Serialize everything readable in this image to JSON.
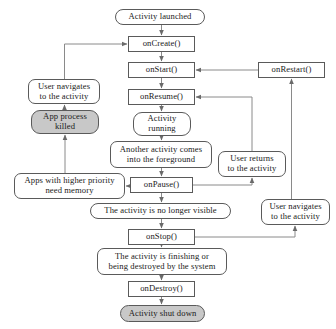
{
  "diagram": {
    "type": "flowchart",
    "canvas": {
      "width": 336,
      "height": 329
    },
    "colors": {
      "stroke": "#5a5a5a",
      "text": "#1a1a1a",
      "terminal_fill": "#c8c8c8",
      "node_fill": "#ffffff"
    },
    "nodes": [
      {
        "id": "activity-launched",
        "label": "Activity launched",
        "shape": "pill",
        "fill": "white",
        "x": 115,
        "y": 9,
        "w": 90,
        "h": 16
      },
      {
        "id": "on-create",
        "label": "onCreate()",
        "shape": "rect",
        "fill": "white",
        "x": 128,
        "y": 36,
        "w": 67,
        "h": 16
      },
      {
        "id": "on-start",
        "label": "onStart()",
        "shape": "rect",
        "fill": "white",
        "x": 128,
        "y": 62,
        "w": 67,
        "h": 16
      },
      {
        "id": "on-restart",
        "label": "onRestart()",
        "shape": "rect",
        "fill": "white",
        "x": 258,
        "y": 62,
        "w": 67,
        "h": 16
      },
      {
        "id": "user-navigates-left",
        "label": "User navigates\nto the activity",
        "shape": "round",
        "fill": "white",
        "x": 28,
        "y": 79,
        "w": 72,
        "h": 25
      },
      {
        "id": "on-resume",
        "label": "onResume()",
        "shape": "rect",
        "fill": "white",
        "x": 128,
        "y": 89,
        "w": 67,
        "h": 16
      },
      {
        "id": "app-process-killed",
        "label": "App process\nkilled",
        "shape": "pill",
        "fill": "gray",
        "x": 31,
        "y": 110,
        "w": 68,
        "h": 24
      },
      {
        "id": "activity-running",
        "label": "Activity\nrunning",
        "shape": "pill",
        "fill": "white",
        "x": 133,
        "y": 112,
        "w": 58,
        "h": 24
      },
      {
        "id": "another-activity",
        "label": "Another activity comes\ninto the foreground",
        "shape": "round",
        "fill": "white",
        "x": 110,
        "y": 141,
        "w": 102,
        "h": 27
      },
      {
        "id": "user-returns",
        "label": "User returns\nto the activity",
        "shape": "round",
        "fill": "white",
        "x": 218,
        "y": 151,
        "w": 68,
        "h": 26
      },
      {
        "id": "apps-higher-priority",
        "label": "Apps with higher priority\nneed memory",
        "shape": "round",
        "fill": "white",
        "x": 14,
        "y": 173,
        "w": 111,
        "h": 26
      },
      {
        "id": "on-pause",
        "label": "onPause()",
        "shape": "rect",
        "fill": "white",
        "x": 130,
        "y": 177,
        "w": 63,
        "h": 16
      },
      {
        "id": "no-longer-visible",
        "label": "The activity is no longer visible",
        "shape": "pill",
        "fill": "white",
        "x": 90,
        "y": 203,
        "w": 141,
        "h": 16
      },
      {
        "id": "user-navigates-right",
        "label": "User navigates\nto the activity",
        "shape": "round",
        "fill": "white",
        "x": 261,
        "y": 199,
        "w": 69,
        "h": 26
      },
      {
        "id": "on-stop",
        "label": "onStop()",
        "shape": "rect",
        "fill": "white",
        "x": 128,
        "y": 229,
        "w": 67,
        "h": 16
      },
      {
        "id": "finishing-destroyed",
        "label": "The activity is finishing or\nbeing destroyed by the system",
        "shape": "round",
        "fill": "white",
        "x": 97,
        "y": 248,
        "w": 130,
        "h": 27
      },
      {
        "id": "on-destroy",
        "label": "onDestroy()",
        "shape": "rect",
        "fill": "white",
        "x": 128,
        "y": 281,
        "w": 67,
        "h": 16
      },
      {
        "id": "activity-shut-down",
        "label": "Activity shut down",
        "shape": "pill",
        "fill": "gray",
        "x": 120,
        "y": 305,
        "w": 85,
        "h": 17
      }
    ],
    "edges": [
      {
        "from": "activity-launched",
        "to": "on-create",
        "label": ""
      },
      {
        "from": "on-create",
        "to": "on-start",
        "label": ""
      },
      {
        "from": "on-start",
        "to": "on-resume",
        "label": ""
      },
      {
        "from": "on-resume",
        "to": "activity-running",
        "label": ""
      },
      {
        "from": "activity-running",
        "to": "another-activity",
        "label": ""
      },
      {
        "from": "another-activity",
        "to": "on-pause",
        "label": ""
      },
      {
        "from": "on-pause",
        "to": "no-longer-visible",
        "label": ""
      },
      {
        "from": "no-longer-visible",
        "to": "on-stop",
        "label": ""
      },
      {
        "from": "on-stop",
        "to": "finishing-destroyed",
        "label": ""
      },
      {
        "from": "finishing-destroyed",
        "to": "on-destroy",
        "label": ""
      },
      {
        "from": "on-destroy",
        "to": "activity-shut-down",
        "label": ""
      },
      {
        "from": "on-pause",
        "to": "apps-higher-priority",
        "label": ""
      },
      {
        "from": "apps-higher-priority",
        "to": "app-process-killed",
        "label": ""
      },
      {
        "from": "app-process-killed",
        "to": "user-navigates-left",
        "label": ""
      },
      {
        "from": "user-navigates-left",
        "to": "on-create",
        "label": ""
      },
      {
        "from": "user-returns",
        "to": "on-resume",
        "label": ""
      },
      {
        "from": "on-pause",
        "to": "user-returns",
        "label": ""
      },
      {
        "from": "user-navigates-right",
        "to": "on-restart",
        "label": ""
      },
      {
        "from": "on-stop",
        "to": "user-navigates-right",
        "label": ""
      },
      {
        "from": "on-restart",
        "to": "on-start",
        "label": ""
      }
    ]
  }
}
